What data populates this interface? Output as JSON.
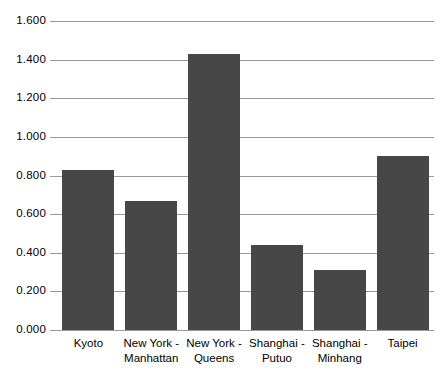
{
  "chart_data": {
    "type": "bar",
    "title": "",
    "subtitle": "",
    "xlabel": "",
    "ylabel": "",
    "categories": [
      "Kyoto",
      "New York -\nManhattan",
      "New York -\nQueens",
      "Shanghai -\nPutuo",
      "Shanghai -\nMinhang",
      "Taipei"
    ],
    "values": [
      0.83,
      0.67,
      1.43,
      0.44,
      0.31,
      0.9
    ],
    "ylim": [
      0.0,
      1.6
    ],
    "ytick_values": [
      0.0,
      0.2,
      0.4,
      0.6,
      0.8,
      1.0,
      1.2,
      1.4,
      1.6
    ],
    "ytick_labels": [
      "0.000",
      "0.200",
      "0.400",
      "0.600",
      "0.800",
      "1.000",
      "1.200",
      "1.400",
      "1.600"
    ],
    "grid": true,
    "grid_axis": "y",
    "legend": false,
    "legend_position": "none",
    "bar_color": "#474747",
    "gridline_color": "#9a9a9a",
    "background_color": "#ffffff"
  }
}
